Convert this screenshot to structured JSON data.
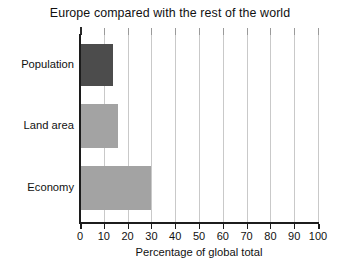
{
  "chart_data": {
    "type": "bar",
    "orientation": "horizontal",
    "title": "Europe compared with the rest of the world",
    "xlabel": "Percentage of global total",
    "ylabel": "",
    "categories": [
      "Population",
      "Land area",
      "Economy"
    ],
    "values": [
      14,
      16,
      30
    ],
    "xlim": [
      0,
      100
    ],
    "xticks": [
      0,
      10,
      20,
      30,
      40,
      50,
      60,
      70,
      80,
      90,
      100
    ],
    "xtick_labels": [
      "0",
      "10",
      "20",
      "30",
      "40",
      "50",
      "60",
      "70",
      "80",
      "90",
      "100"
    ],
    "grid": "vertical",
    "legend": "none",
    "series": [
      {
        "name": "Percentage of global total",
        "points": [
          {
            "category": "Population",
            "value": 14,
            "color": "#4c4c4c"
          },
          {
            "category": "Land area",
            "value": 16,
            "color": "#a3a3a3"
          },
          {
            "category": "Economy",
            "value": 30,
            "color": "#a3a3a3"
          }
        ]
      }
    ],
    "colors": {
      "population_bar": "#4c4c4c",
      "land_area_bar": "#a3a3a3",
      "economy_bar": "#a3a3a3",
      "gridline": "#c9c9c9",
      "axis": "#1c1c1c",
      "background": "#ffffff",
      "text": "#111111"
    }
  }
}
